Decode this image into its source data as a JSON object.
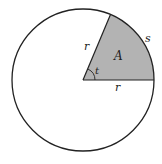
{
  "diagram": {
    "labels": {
      "radius_upper": "r",
      "radius_lower": "r",
      "area": "A",
      "arc": "s",
      "angle": "t"
    },
    "colors": {
      "sector_fill": "#b3b3b3",
      "stroke": "#222222",
      "background": "#ffffff"
    }
  }
}
